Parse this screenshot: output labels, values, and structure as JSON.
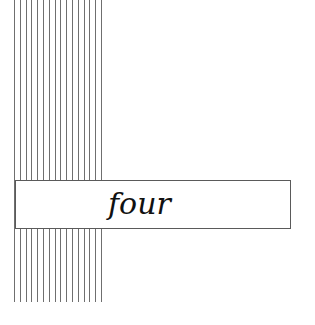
{
  "chapter": {
    "title": "four"
  },
  "decoration": {
    "line_count": 16,
    "line_color": "#6f6f6f"
  }
}
